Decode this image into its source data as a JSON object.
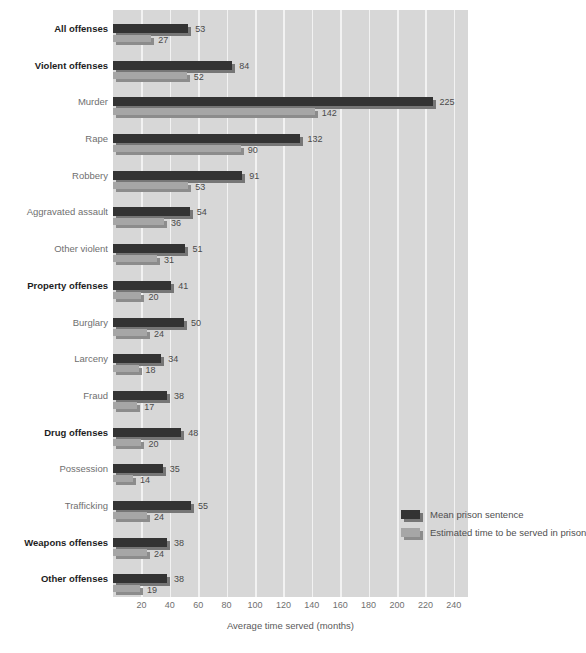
{
  "chart_data": {
    "type": "bar",
    "orientation": "horizontal",
    "title": "",
    "xlabel": "Average time served (months)",
    "ylabel": "",
    "xlim": [
      0,
      250
    ],
    "xticks": [
      20,
      40,
      60,
      80,
      100,
      120,
      140,
      160,
      180,
      200,
      220,
      240
    ],
    "grid": true,
    "legend_position": "inside-lower-right",
    "categories": [
      "All offenses",
      "Violent offenses",
      "Murder",
      "Rape",
      "Robbery",
      "Aggravated assault",
      "Other violent",
      "Property offenses",
      "Burglary",
      "Larceny",
      "Fraud",
      "Drug offenses",
      "Possession",
      "Trafficking",
      "Weapons offenses",
      "Other offenses"
    ],
    "category_emphasis": [
      true,
      true,
      false,
      false,
      false,
      false,
      false,
      true,
      false,
      false,
      false,
      true,
      false,
      false,
      true,
      true
    ],
    "series": [
      {
        "name": "Mean prison sentence",
        "color": "#333333",
        "values": [
          53,
          84,
          225,
          132,
          91,
          54,
          51,
          41,
          50,
          34,
          38,
          48,
          35,
          55,
          38,
          38
        ]
      },
      {
        "name": "Estimated time to be served in prison",
        "color": "#a6a6a6",
        "values": [
          27,
          52,
          142,
          90,
          53,
          36,
          31,
          20,
          24,
          18,
          17,
          20,
          14,
          24,
          24,
          19
        ]
      }
    ]
  },
  "legend": {
    "items": [
      {
        "label": "Mean prison sentence",
        "swatch": "dark"
      },
      {
        "label": "Estimated time to be served in prison",
        "swatch": "light"
      }
    ]
  },
  "axis": {
    "x_title": "Average time served (months)"
  },
  "colors": {
    "panel_background": "#d7d7d7",
    "gridline": "#f2f2f2",
    "series_dark": "#333333",
    "series_light": "#a6a6a6",
    "shadow_dark": "#767676",
    "shadow_light": "#8c8c8c",
    "label_muted": "#6f6f6f",
    "label_bold": "#1d1d1d",
    "value_label": "#4a4a4a"
  }
}
